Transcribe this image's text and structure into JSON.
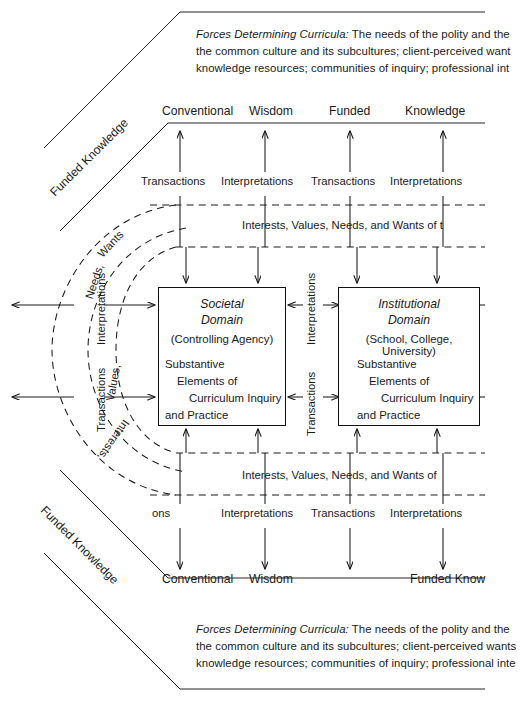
{
  "figure": {
    "type": "curriculum-domains-diagram",
    "ink_color": "#1a1a1a",
    "background": "#ffffff"
  },
  "top_banner": {
    "lead_italic": "Forces Determining Curricula:",
    "line1_rest": " The needs of the polity and the",
    "line2": "the common culture and its subcultures; client-perceived want",
    "line3": "knowledge resources; communities of inquiry; professional int"
  },
  "bottom_banner": {
    "lead_italic": "Forces Determining Curricula:",
    "line1_rest": " The needs of the polity and the",
    "line2": "the common culture and its subcultures; client-perceived wants",
    "line3": "knowledge resources; communities of inquiry; professional inte"
  },
  "top_outcomes": [
    {
      "label": "Conventional"
    },
    {
      "label": "Wisdom"
    },
    {
      "label": "Funded"
    },
    {
      "label": "Knowledge"
    }
  ],
  "bottom_outcomes": [
    {
      "label": "Conventional"
    },
    {
      "label": "Wisdom"
    },
    {
      "label": "Funded Know"
    }
  ],
  "top_modes": [
    {
      "label": "Transactions"
    },
    {
      "label": "Interpretations"
    },
    {
      "label": "Transactions"
    },
    {
      "label": "Interpretations"
    }
  ],
  "bottom_modes": [
    {
      "label": "ons"
    },
    {
      "label": "Interpretations"
    },
    {
      "label": "Transactions"
    },
    {
      "label": "Interpretations"
    }
  ],
  "band_top_text": "Interests,  Values,  Needs,  and  Wants  of  t",
  "band_bottom_text": "Interests,  Values,  Needs,  and  Wants  of",
  "left_edge_labels": [
    {
      "label": "Interpretations"
    },
    {
      "label": "Transactions"
    }
  ],
  "center_labels": [
    {
      "label": "Interpretations"
    },
    {
      "label": "Transactions"
    }
  ],
  "diagonal_labels": [
    {
      "label": "Funded Knowledge",
      "position": "upper-left"
    },
    {
      "label": "Funded Knowledge",
      "position": "lower-left"
    }
  ],
  "arc_labels": [
    {
      "label": "Wants"
    },
    {
      "label": "Needs,"
    },
    {
      "label": "Values,"
    },
    {
      "label": "Interests,"
    }
  ],
  "societal_box": {
    "title_line1": "Societal",
    "title_line2": "Domain",
    "subtitle": "(Controlling Agency)",
    "body": [
      "Substantive",
      "Elements of",
      "Curriculum Inquiry",
      "and Practice"
    ]
  },
  "institutional_box": {
    "title_line1": "Institutional",
    "title_line2": "Domain",
    "subtitle": "(School, College, University)",
    "body": [
      "Substantive",
      "Elements of",
      "Curriculum Inquiry",
      "and Practice"
    ]
  }
}
